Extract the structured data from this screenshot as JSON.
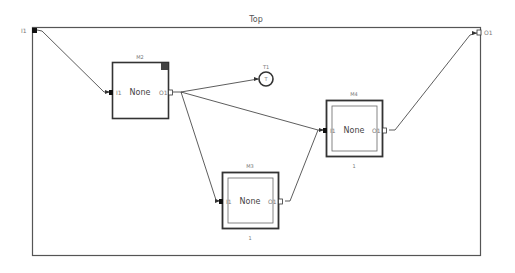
{
  "diagram": {
    "title": "Top",
    "frame": {
      "x": 32,
      "y": 27,
      "w": 448,
      "h": 228
    },
    "inputs": [
      {
        "id": "I1",
        "label": "I1",
        "x": 32,
        "y": 30
      }
    ],
    "outputs": [
      {
        "id": "O1",
        "label": "O1",
        "x": 480,
        "y": 33
      }
    ],
    "blocks": [
      {
        "id": "M2",
        "label": "M2",
        "content": "None",
        "in_port": "I1",
        "out_port": "O1",
        "x": 112,
        "y": 62,
        "w": 56,
        "h": 56,
        "style": "single",
        "corner_marker": true,
        "footer": ""
      },
      {
        "id": "M3",
        "label": "M3",
        "content": "None",
        "in_port": "I1",
        "out_port": "O1",
        "x": 222,
        "y": 172,
        "w": 56,
        "h": 56,
        "style": "double",
        "corner_marker": false,
        "footer": "1"
      },
      {
        "id": "M4",
        "label": "M4",
        "content": "None",
        "in_port": "I1",
        "out_port": "O1",
        "x": 326,
        "y": 100,
        "w": 56,
        "h": 56,
        "style": "double",
        "corner_marker": false,
        "footer": "1"
      }
    ],
    "terminals": [
      {
        "id": "T1",
        "label": "T1",
        "symbol": "T",
        "x": 266,
        "y": 79,
        "r": 7
      }
    ],
    "connections": [
      {
        "from": "I1",
        "to": "M2.I1"
      },
      {
        "from": "M2.O1",
        "to": "T1"
      },
      {
        "from": "M2.O1",
        "to": "M4.I1"
      },
      {
        "from": "M2.O1",
        "to": "M3.I1"
      },
      {
        "from": "M3.O1",
        "to": "M4.I1"
      },
      {
        "from": "M4.O1",
        "to": "O1"
      }
    ],
    "colors": {
      "line": "#333333",
      "frame": "#555555",
      "block_border": "#333333",
      "port_fill": "#111111"
    }
  }
}
